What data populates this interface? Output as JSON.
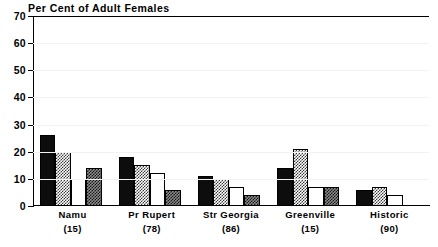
{
  "chart_data": {
    "type": "bar",
    "title": "Per Cent of Adult Females",
    "xlabel": "",
    "ylabel": "",
    "ylim": [
      0,
      70
    ],
    "yticks": [
      0,
      10,
      20,
      30,
      40,
      50,
      60,
      70
    ],
    "ytick_labels": [
      "0",
      "10",
      "20",
      "30",
      "40",
      "50",
      "60",
      "70"
    ],
    "grid": false,
    "legend": "none",
    "categories": [
      "Namu",
      "Pr Rupert",
      "Str Georgia",
      "Greenville",
      "Historic"
    ],
    "category_counts": [
      "(15)",
      "(78)",
      "(86)",
      "(15)",
      "(90)"
    ],
    "category_labels": [
      "Namu\n(15)",
      "Pr Rupert\n(78)",
      "Str Georgia\n(86)",
      "Greenville\n(15)",
      "Historic\n(90)"
    ],
    "series": [
      {
        "name": "series-1",
        "fill": "black",
        "values": [
          26,
          18,
          11,
          14,
          6
        ]
      },
      {
        "name": "series-2",
        "fill": "check-light",
        "values": [
          20,
          15,
          10,
          21,
          7
        ]
      },
      {
        "name": "series-3",
        "fill": "white",
        "values": [
          10,
          12,
          7,
          7,
          4
        ]
      },
      {
        "name": "series-4",
        "fill": "check-dark",
        "values": [
          14,
          6,
          4,
          7,
          0
        ]
      }
    ]
  },
  "colors": {
    "axis": "#000000",
    "background": "#ffffff",
    "bar_black": "#0d0d0d",
    "bar_white": "#ffffff",
    "bar_check_light": "#3a3a3a",
    "bar_check_dark": "#8a8a8a",
    "gridline": "#f2f2f2"
  }
}
